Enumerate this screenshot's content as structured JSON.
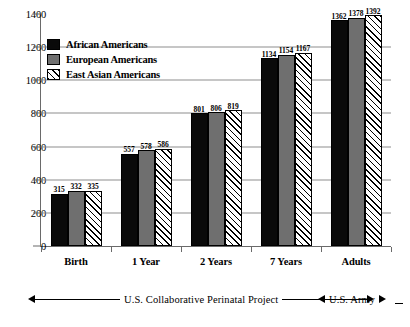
{
  "chart_data": {
    "type": "bar",
    "title": "",
    "subtitle": "",
    "xlabel": "",
    "ylabel": "",
    "categories": [
      "Birth",
      "1 Year",
      "2 Years",
      "7 Years",
      "Adults"
    ],
    "series": [
      {
        "name": "African Americans",
        "color": "#0a0a0a",
        "fill": "solid-black",
        "values": [
          315,
          557,
          801,
          1134,
          1362
        ]
      },
      {
        "name": "European Americans",
        "color": "#6f6f6f",
        "fill": "solid-gray",
        "values": [
          332,
          578,
          806,
          1154,
          1378
        ]
      },
      {
        "name": "East Asian Americans",
        "color": "#ffffff",
        "fill": "diagonal-hatch",
        "values": [
          335,
          586,
          819,
          1167,
          1392
        ]
      }
    ],
    "ylim": [
      0,
      1400
    ],
    "yticks": [
      0,
      200,
      400,
      600,
      800,
      1000,
      1200,
      1400
    ],
    "ytick_labels": [
      "0",
      "200",
      "400",
      "600",
      "800",
      "1000",
      "1200",
      "1400"
    ],
    "grid": "horizontal gridlines at 200, 400, 600, 800, 1000, 1200",
    "gridlines": [
      200,
      400,
      600,
      800,
      1000,
      1200
    ],
    "legend_position": "upper-left-inside",
    "data_labels": true,
    "annotations": [
      {
        "text": "U.S. Collaborative  Perinatal Project",
        "arrow": "double-headed",
        "span_categories": [
          "Birth",
          "1 Year",
          "2 Years",
          "7 Years"
        ]
      },
      {
        "text": "U.S. Army",
        "arrow": "double-headed",
        "span_categories": [
          "Adults"
        ]
      }
    ]
  },
  "legend": {
    "items": [
      {
        "label": "African Americans",
        "swatch": "african"
      },
      {
        "label": "European Americans",
        "swatch": "european"
      },
      {
        "label": "East Asian Americans",
        "swatch": "eastasian"
      }
    ]
  },
  "annotations": {
    "cpp_label": "U.S. Collaborative  Perinatal Project",
    "army_label": "U.S. Army"
  }
}
